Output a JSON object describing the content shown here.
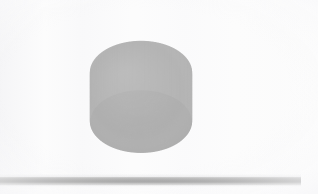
{
  "scene": {
    "title": "3D Surface Render",
    "background_color": "#fcfcfc",
    "canvas_width": 318,
    "canvas_height": 194,
    "render_style": "flat-shaded-grayscale"
  },
  "base_bar": {
    "name": "horizontal-rule",
    "color_top": "#cfcfcf",
    "color_mid": "#9b9b9b",
    "color_bottom": "#c6c6c6",
    "x": 0,
    "y": 177,
    "width": 301,
    "height": 7
  },
  "object": {
    "label": "revolved-bowl-surface",
    "bounds": {
      "x": 82,
      "y": 28,
      "width": 118,
      "height": 137
    },
    "description": "Grayscale shaded solid of revolution resembling a cylinder with a concave crater-like depression on the top face",
    "colors": {
      "rim_top_light": "#bdbdbd",
      "rim_top_shadow": "#9a9a9a",
      "inner_bowl_dark": "#939393",
      "inner_bowl_light": "#c3c3c3",
      "side_wall_light": "#c8c8c8",
      "side_wall_mid": "#b0b0b0",
      "silhouette_edge": "#8c8c8c",
      "highlight": "#d6d6d6"
    }
  },
  "chart_data": {
    "type": "surface",
    "title": "",
    "xlabel": "",
    "ylabel": "",
    "zlabel": "",
    "grid": false,
    "legend": false,
    "axes_visible": false,
    "projection": "perspective",
    "view": {
      "azimuth_deg": -35,
      "elevation_deg": 38
    },
    "surface_model": {
      "form": "z = h_rim - depth * exp(-(r/sigma)^2)",
      "radius": 1.0,
      "rim_height": 0.62,
      "crater_depth": 0.5,
      "sigma": 0.55
    },
    "shading": {
      "colormap": "gray",
      "light_azimuth_deg": 135,
      "light_elevation_deg": 55,
      "value_range": [
        0.55,
        0.85
      ]
    }
  }
}
